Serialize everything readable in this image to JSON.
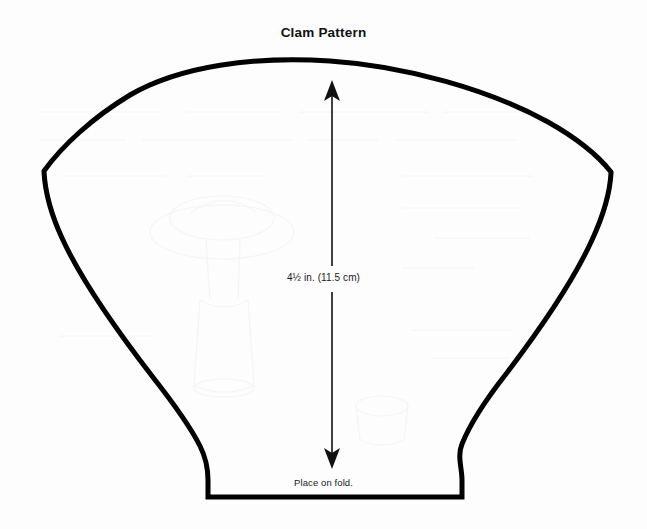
{
  "document": {
    "title": "Clam Pattern",
    "type": "sewing-pattern-template",
    "background_color": "#fdfdfd",
    "ink_color": "#000000"
  },
  "title": {
    "text": "Clam Pattern"
  },
  "annotations": {
    "height_measure": {
      "text": "4½ in. (11.5 cm)",
      "value_inches": 4.5,
      "value_cm": 11.5,
      "arrow": "double-headed-vertical"
    },
    "fold_instruction": {
      "text": "Place on fold."
    }
  },
  "shape": {
    "name": "clam-shell-outline",
    "stroke_color": "#000000",
    "stroke_width": 5,
    "fill": "none",
    "description": "Fan / clam shell silhouette with a wide domed top arc, sharp shoulder corners at left and right, sides sweeping down and inward to two small feet resting on a flat fold line at the base."
  },
  "icons": {
    "arrow_up": "arrow-up-icon",
    "arrow_down": "arrow-down-icon"
  }
}
